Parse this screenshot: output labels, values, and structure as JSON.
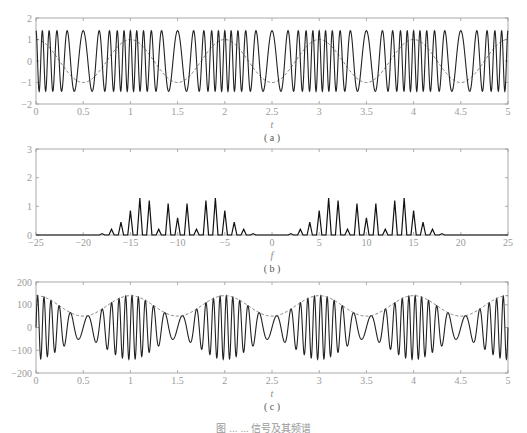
{
  "chart_data": [
    {
      "id": "a",
      "type": "line",
      "subtitle": "( a )",
      "xlabel": "t",
      "ylabel": "",
      "xlim": [
        0,
        5
      ],
      "ylim": [
        -2,
        2
      ],
      "xticks": [
        "0",
        "0.5",
        "1",
        "1.5",
        "2",
        "2.5",
        "3",
        "3.5",
        "4",
        "4.5",
        "5"
      ],
      "yticks": [
        "-2",
        "-1",
        "0",
        "1",
        "2"
      ],
      "grid": false,
      "series": [
        {
          "name": "FM signal",
          "style": "solid",
          "amplitude": 1.41,
          "carrier_freq": 10,
          "mod_index": 5,
          "mod_freq": 1
        },
        {
          "name": "modulating signal",
          "style": "dashed",
          "amplitude": 1,
          "freq": 1,
          "phase": "cos"
        }
      ]
    },
    {
      "id": "b",
      "type": "line",
      "subtitle": "( b )",
      "xlabel": "f",
      "ylabel": "",
      "xlim": [
        -25,
        25
      ],
      "ylim": [
        0,
        3
      ],
      "xticks": [
        "-25",
        "-20",
        "-15",
        "-10",
        "-5",
        "0",
        "5",
        "10",
        "15",
        "20",
        "25"
      ],
      "yticks": [
        "0",
        "1",
        "2",
        "3"
      ],
      "grid": false,
      "x": [
        -18,
        -17,
        -16,
        -15,
        -14,
        -13,
        -12,
        -11,
        -10,
        -9,
        -8,
        -7,
        -6,
        -5,
        -4,
        -3,
        -2,
        2,
        3,
        4,
        5,
        6,
        7,
        8,
        9,
        10,
        11,
        12,
        13,
        14,
        15,
        16,
        17,
        18
      ],
      "values": [
        0.05,
        0.2,
        0.45,
        0.85,
        1.29,
        1.2,
        0.2,
        1.1,
        0.6,
        1.1,
        0.2,
        1.2,
        1.29,
        0.85,
        0.45,
        0.2,
        0.05,
        0.05,
        0.2,
        0.45,
        0.85,
        1.29,
        1.2,
        0.2,
        1.1,
        0.6,
        1.1,
        0.2,
        1.2,
        1.29,
        0.85,
        0.45,
        0.2,
        0.05
      ]
    },
    {
      "id": "c",
      "type": "line",
      "subtitle": "( c )",
      "xlabel": "t",
      "ylabel": "",
      "xlim": [
        0,
        5
      ],
      "ylim": [
        -200,
        200
      ],
      "xticks": [
        "0",
        "0.5",
        "1",
        "1.5",
        "2",
        "2.5",
        "3",
        "3.5",
        "4",
        "4.5",
        "5"
      ],
      "yticks": [
        "-200",
        "-100",
        "0",
        "100",
        "200"
      ],
      "grid": false,
      "series": [
        {
          "name": "differentiated FM signal",
          "style": "solid",
          "carrier_freq": 10,
          "mod_index": 5,
          "mod_freq": 1
        },
        {
          "name": "envelope",
          "style": "dashed",
          "offset": 95,
          "amplitude": 45,
          "freq": 1
        }
      ]
    }
  ],
  "caption": "图 ... ... 信号及其频谱"
}
